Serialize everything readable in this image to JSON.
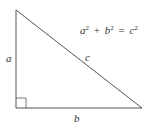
{
  "diagram": {
    "colors": {
      "stroke": "#555555",
      "text": "#333333",
      "background": "#ffffff"
    },
    "triangle": {
      "vertices": {
        "top": [
          16,
          10
        ],
        "right_angle": [
          16,
          108
        ],
        "bottom_right": [
          142,
          108
        ]
      },
      "right_angle_marker_size": 10
    },
    "labels": {
      "vertical_leg": "a",
      "horizontal_leg": "b",
      "hypotenuse": "c"
    },
    "equation": {
      "term1_var": "a",
      "term1_exp": "2",
      "plus": "+",
      "term2_var": "b",
      "term2_exp": "2",
      "equals": "=",
      "term3_var": "c",
      "term3_exp": "2"
    }
  }
}
